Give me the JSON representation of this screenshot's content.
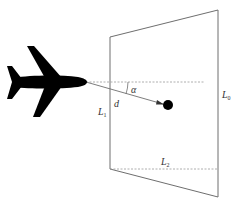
{
  "diagram": {
    "type": "geometry-illustration",
    "colors": {
      "line": "#6e6e6e",
      "dashed": "#9a9a9a",
      "silhouette": "#000000",
      "label": "#333333"
    },
    "labels": {
      "alpha": "α",
      "d": "d",
      "L1": {
        "main": "L",
        "sub": "1"
      },
      "L0": {
        "main": "L",
        "sub": "0"
      },
      "L2": {
        "main": "L",
        "sub": "2"
      }
    },
    "elements": [
      {
        "id": "airplane",
        "icon": "airplane-icon"
      },
      {
        "id": "target-point",
        "icon": "filled-circle"
      },
      {
        "id": "plane-trapezoid",
        "shape": "trapezoid"
      },
      {
        "id": "horizontal-reference",
        "style": "dashed"
      },
      {
        "id": "line-of-sight",
        "style": "arrow"
      },
      {
        "id": "bottom-width",
        "style": "dashed"
      }
    ]
  }
}
